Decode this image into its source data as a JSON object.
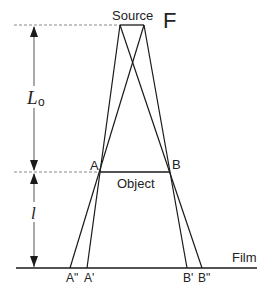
{
  "diagram": {
    "title_letter": "F",
    "labels": {
      "source": "Source",
      "object": "Object",
      "film": "Film",
      "point_a": "A",
      "point_b": "B",
      "image_a_prime": "A'",
      "image_a_double_prime": "A\"",
      "image_b_prime": "B'",
      "image_b_double_prime": "B\"",
      "source_object_distance_symbol": "L",
      "source_object_distance_subscript": "o",
      "object_film_distance_symbol": "l"
    },
    "colors": {
      "line": "#1a1a1a",
      "dashed": "#777777",
      "text": "#222222"
    }
  }
}
